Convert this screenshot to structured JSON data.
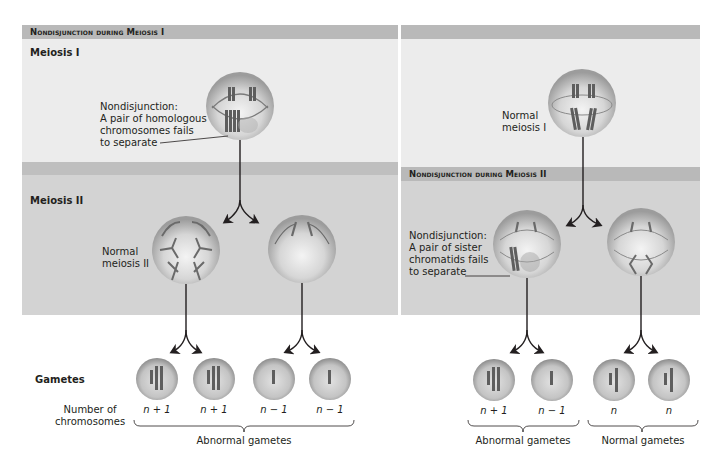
{
  "figure": {
    "left_panel": {
      "header": "Nondisjunction during Meiosis I",
      "meiosis1_label": "Meiosis I",
      "meiosis2_label": "Meiosis II",
      "nondisjunction_caption": [
        "Nondisjunction:",
        "A pair of homologous",
        "chromosomes fails",
        "to separate"
      ],
      "normal_meiosis2_caption": [
        "Normal",
        "meiosis II"
      ],
      "gametes_label": "Gametes",
      "number_label": [
        "Number of",
        "chromosomes"
      ],
      "gamete_counts": [
        "n + 1",
        "n + 1",
        "n − 1",
        "n − 1"
      ],
      "bracket_label": "Abnormal gametes"
    },
    "right_panel": {
      "header": "Nondisjunction during Meiosis II",
      "normal_meiosis1_caption": [
        "Normal",
        "meiosis I"
      ],
      "nondisjunction_caption": [
        "Nondisjunction:",
        "A pair of sister",
        "chromatids fails",
        "to separate"
      ],
      "gamete_counts": [
        "n + 1",
        "n − 1",
        "n",
        "n"
      ],
      "bracket_labels": [
        "Abnormal gametes",
        "Normal gametes"
      ]
    },
    "colors": {
      "header_bar": "#b9b9b9",
      "band_light": "#ececec",
      "band_dark": "#d3d3d3",
      "cell": "#c8c8c8",
      "chromosome": "#5e5e5e",
      "arrow": "#231f20"
    }
  }
}
